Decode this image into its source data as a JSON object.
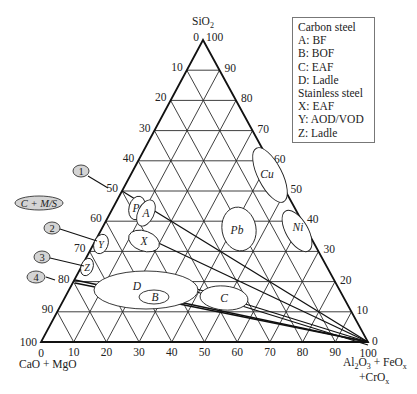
{
  "chart_data": {
    "type": "ternary",
    "title": "",
    "axes": {
      "top": {
        "label": "SiO2",
        "label_parts": [
          "SiO",
          "2"
        ],
        "ticks": [
          0,
          10,
          20,
          30,
          40,
          50,
          60,
          70,
          80,
          90,
          100
        ]
      },
      "left": {
        "label": "CaO + MgO",
        "ticks": [
          0,
          10,
          20,
          30,
          40,
          50,
          60,
          70,
          80,
          90,
          100
        ]
      },
      "right": {
        "label": "Al2O3 + FeOx + CrOx",
        "ticks": [
          0,
          10,
          20,
          30,
          40,
          50,
          60,
          70,
          80,
          90,
          100
        ]
      }
    },
    "vertex_labels": {
      "top_left_tick": "0",
      "top_right_tick": "100",
      "bottom_left_tick": "100",
      "bottom_left_base": "0",
      "bottom_right_tick": "0",
      "bottom_right_base": "100"
    },
    "grid": true,
    "grid_step": 10,
    "regions": [
      {
        "label": "P",
        "desc": "small ellipse near SiO2 ~53"
      },
      {
        "label": "A",
        "desc": "Carbon steel BF slag"
      },
      {
        "label": "X",
        "desc": "Stainless steel EAF slag"
      },
      {
        "label": "Y",
        "desc": "Stainless steel AOD/VOD slag"
      },
      {
        "label": "Z",
        "desc": "Stainless steel ladle slag"
      },
      {
        "label": "D",
        "desc": "Carbon steel ladle slag"
      },
      {
        "label": "B",
        "desc": "Carbon steel BOF slag"
      },
      {
        "label": "C",
        "desc": "Carbon steel EAF slag"
      },
      {
        "label": "Pb",
        "desc": "Pb slag"
      },
      {
        "label": "Cu",
        "desc": "Cu slag"
      },
      {
        "label": "Ni",
        "desc": "Ni slag"
      }
    ],
    "lines": [
      {
        "label": "1",
        "from_left_edge_CaO": 50,
        "to": "Al2O3+FeOx+CrOx apex"
      },
      {
        "label": "2",
        "from_left_edge_CaO": 67,
        "to": "Al2O3+FeOx+CrOx apex"
      },
      {
        "label": "3",
        "from_left_edge_CaO": 75,
        "to": "Al2O3+FeOx+CrOx apex"
      },
      {
        "label": "4",
        "from_left_edge_CaO": 81,
        "to": "Al2O3+FeOx+CrOx apex"
      }
    ],
    "annotation": "C + M/S",
    "legend_position": "top-right"
  },
  "legend": {
    "lines": [
      "Carbon steel",
      "A: BF",
      "B: BOF",
      "C: EAF",
      "D: Ladle",
      "Stainless steel",
      "X: EAF",
      "Y: AOD/VOD",
      "Z: Ladle"
    ]
  },
  "labels": {
    "sio2": "SiO",
    "sio2_sub": "2",
    "cao": "CaO + MgO",
    "al_line1_a": "Al",
    "al_line1_b": "2",
    "al_line1_c": "O",
    "al_line1_d": "3",
    "al_line1_e": " + FeO",
    "al_line1_f": "x",
    "al_line2_a": "+CrO",
    "al_line2_b": "x",
    "ratio": "C + M/S",
    "bubble1": "1",
    "bubble2": "2",
    "bubble3": "3",
    "bubble4": "4",
    "P": "P",
    "A": "A",
    "X": "X",
    "Y": "Y",
    "Z": "Z",
    "D": "D",
    "B": "B",
    "C": "C",
    "Pb": "Pb",
    "Cu": "Cu",
    "Ni": "Ni"
  },
  "colors": {
    "line": "#1a1a1a",
    "grid": "#2a2a2a",
    "bubble_fill": "#d4d4d4"
  }
}
